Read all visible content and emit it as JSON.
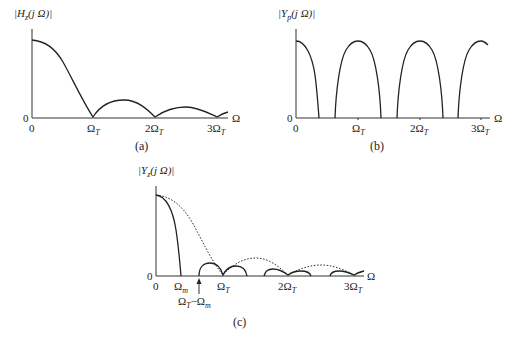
{
  "panels": [
    {
      "id": "a",
      "caption": "(a)",
      "y_label": "|H_z(j Ω)|",
      "y_label_main": "|H",
      "y_label_sub": "z",
      "y_label_rest": "(j Ω)|",
      "y_zero": "0",
      "x_axis_label": "Ω",
      "x_ticks": [
        "0",
        "Ω_T",
        "2Ω_T",
        "3Ω_T"
      ]
    },
    {
      "id": "b",
      "caption": "(b)",
      "y_label": "|Y_p(j Ω)|",
      "y_label_main": "|Y",
      "y_label_sub": "p",
      "y_label_rest": "(j Ω)|",
      "y_zero": "0",
      "x_axis_label": "Ω",
      "x_ticks": [
        "0",
        "Ω_T",
        "2Ω_T",
        "3Ω_T"
      ]
    },
    {
      "id": "c",
      "caption": "(c)",
      "y_label": "|Y_z(j Ω)|",
      "y_label_main": "|Y",
      "y_label_sub": "z",
      "y_label_rest": "(j Ω)|",
      "y_zero": "0",
      "x_axis_label": "Ω",
      "x_ticks": [
        "0",
        "Ω_m",
        "Ω_T",
        "2Ω_T",
        "3Ω_T"
      ],
      "annotation": "Ω_T−Ω_m"
    }
  ],
  "tick": {
    "omega": "Ω",
    "T": "T",
    "m": "m",
    "two": "2",
    "three": "3",
    "minus": "−"
  }
}
